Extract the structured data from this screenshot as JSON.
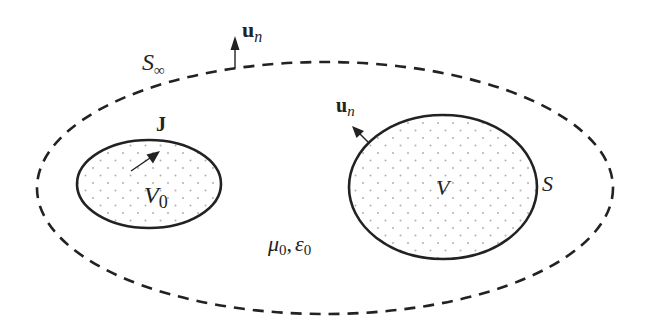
{
  "diagram": {
    "colors": {
      "stroke": "#222222",
      "dot_fill": "#b0b0b0",
      "background": "#ffffff"
    },
    "regions": [
      {
        "id": "outer",
        "kind": "dashed-ellipse",
        "surface_label": "S",
        "surface_subscript": "∞",
        "normal_label": "u",
        "normal_subscript": "n"
      },
      {
        "id": "source",
        "kind": "dotted-ellipse",
        "volume_label": "V",
        "volume_subscript": "0",
        "vector_label": "J"
      },
      {
        "id": "observation",
        "kind": "dotted-ellipse",
        "volume_label": "V",
        "surface_label": "S",
        "normal_label": "u",
        "normal_subscript": "n"
      }
    ],
    "medium": {
      "mu": "μ",
      "mu_sub": "0",
      "sep": ",",
      "eps": "ε",
      "eps_sub": "0"
    }
  }
}
